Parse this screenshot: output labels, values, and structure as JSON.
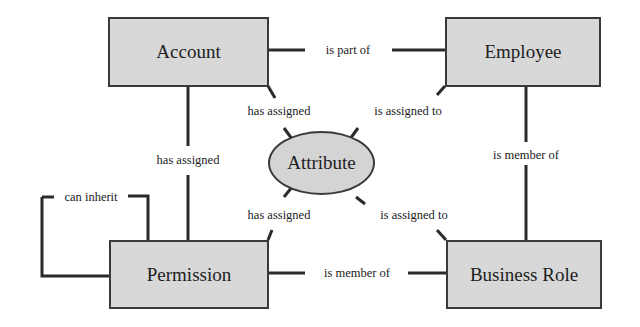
{
  "diagram": {
    "type": "entity-relationship",
    "nodes": {
      "account": {
        "label": "Account",
        "shape": "rectangle"
      },
      "employee": {
        "label": "Employee",
        "shape": "rectangle"
      },
      "permission": {
        "label": "Permission",
        "shape": "rectangle"
      },
      "business_role": {
        "label": "Business Role",
        "shape": "rectangle"
      },
      "attribute": {
        "label": "Attribute",
        "shape": "ellipse"
      }
    },
    "edges": {
      "account_employee": {
        "from": "Account",
        "to": "Employee",
        "label": "is part of"
      },
      "account_permission": {
        "from": "Account",
        "to": "Permission",
        "label": "has assigned"
      },
      "employee_business_role": {
        "from": "Employee",
        "to": "Business Role",
        "label": "is member of"
      },
      "permission_business_role": {
        "from": "Permission",
        "to": "Business Role",
        "label": "is member of"
      },
      "account_attribute": {
        "from": "Account",
        "to": "Attribute",
        "label": "has assigned"
      },
      "employee_attribute": {
        "from": "Employee",
        "to": "Attribute",
        "label": "is assigned to"
      },
      "permission_attribute": {
        "from": "Permission",
        "to": "Attribute",
        "label": "has assigned"
      },
      "business_role_attribute": {
        "from": "Business Role",
        "to": "Attribute",
        "label": "is assigned to"
      },
      "permission_self": {
        "from": "Permission",
        "to": "Permission",
        "label": "can inherit"
      }
    },
    "colors": {
      "fill": "#d8d8d8",
      "stroke": "#3a3a3a",
      "text": "#1e1e1e"
    }
  }
}
